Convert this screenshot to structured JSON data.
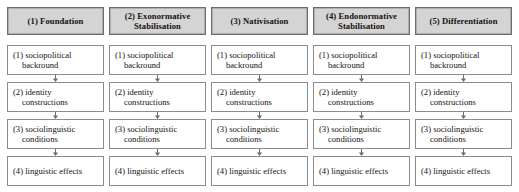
{
  "diagram": {
    "colors": {
      "header_fill": "#d4d4d4",
      "header_border": "#6d6d6d",
      "box_border": "#8c8c8c",
      "box_fill": "#ffffff",
      "text": "#16120f",
      "arrow": "#6d6d6d"
    },
    "columns": [
      {
        "header": {
          "number": "(1)",
          "label": "(1) Foundation",
          "line1": "(1) Foundation",
          "line2": ""
        },
        "stages": [
          {
            "label": "(1) sociopolitical backround",
            "line1": "(1) sociopolitical",
            "line2": "backround"
          },
          {
            "label": "(2) identity constructions",
            "line1": "(2) identity",
            "line2": "constructions"
          },
          {
            "label": "(3) sociolinguistic conditions",
            "line1": "(3) sociolinguistic",
            "line2": "conditions"
          },
          {
            "label": "(4) linguistic effects",
            "line1": "(4) linguistic effects",
            "line2": ""
          }
        ],
        "arrows": [
          "down-arrow",
          "down-arrow",
          "down-arrow"
        ]
      },
      {
        "header": {
          "number": "(2)",
          "label": "(2) Exonormative Stabilisation",
          "line1": "(2) Exonormative",
          "line2": "Stabilisation"
        },
        "stages": [
          {
            "label": "(1) sociopolitical backround",
            "line1": "(1) sociopolitical",
            "line2": "backround"
          },
          {
            "label": "(2) identity constructions",
            "line1": "(2) identity",
            "line2": "constructions"
          },
          {
            "label": "(3) sociolinguistic conditions",
            "line1": "(3) sociolinguistic",
            "line2": "conditions"
          },
          {
            "label": "(4) linguistic effects",
            "line1": "(4) linguistic effects",
            "line2": ""
          }
        ],
        "arrows": [
          "down-arrow",
          "down-arrow",
          "down-arrow"
        ]
      },
      {
        "header": {
          "number": "(3)",
          "label": "(3) Nativisation",
          "line1": "(3) Nativisation",
          "line2": ""
        },
        "stages": [
          {
            "label": "(1) sociopolitical backround",
            "line1": "(1) sociopolitical",
            "line2": "backround"
          },
          {
            "label": "(2) identity constructions",
            "line1": "(2) identity",
            "line2": "constructions"
          },
          {
            "label": "(3) sociolinguistic conditions",
            "line1": "(3) sociolinguistic",
            "line2": "conditions"
          },
          {
            "label": "(4) linguistic effects",
            "line1": "(4) linguistic effects",
            "line2": ""
          }
        ],
        "arrows": [
          "down-arrow",
          "down-arrow",
          "down-arrow"
        ]
      },
      {
        "header": {
          "number": "(4)",
          "label": "(4) Endonormative Stabilisation",
          "line1": "(4) Endonormative",
          "line2": "Stabilisation"
        },
        "stages": [
          {
            "label": "(1) sociopolitical backround",
            "line1": "(1) sociopolitical",
            "line2": "backround"
          },
          {
            "label": "(2) identity constructions",
            "line1": "(2) identity",
            "line2": "constructions"
          },
          {
            "label": "(3) sociolinguistic conditions",
            "line1": "(3) sociolinguistic",
            "line2": "conditions"
          },
          {
            "label": "(4) linguistic effects",
            "line1": "(4) linguistic effects",
            "line2": ""
          }
        ],
        "arrows": [
          "down-arrow",
          "down-arrow",
          "down-arrow"
        ]
      },
      {
        "header": {
          "number": "(5)",
          "label": "(5) Differentiation",
          "line1": "(5) Differentiation",
          "line2": ""
        },
        "stages": [
          {
            "label": "(1) sociopolitical backround",
            "line1": "(1) sociopolitical",
            "line2": "backround"
          },
          {
            "label": "(2) identity constructions",
            "line1": "(2) identity",
            "line2": "constructions"
          },
          {
            "label": "(3) sociolinguistic conditions",
            "line1": "(3) sociolinguistic",
            "line2": "conditions"
          },
          {
            "label": "(4) linguistic effects",
            "line1": "(4) linguistic effects",
            "line2": ""
          }
        ],
        "arrows": [
          "down-arrow",
          "down-arrow",
          "down-arrow"
        ]
      }
    ]
  }
}
